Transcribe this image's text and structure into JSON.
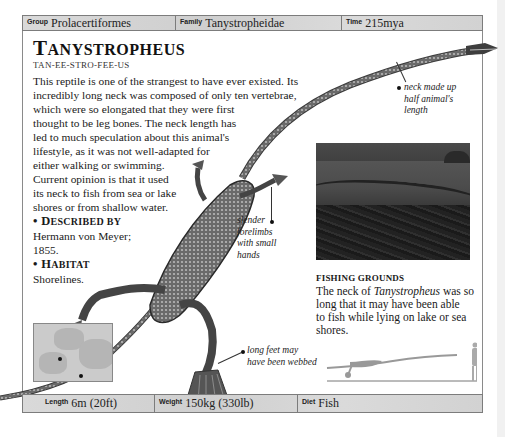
{
  "header": {
    "group": {
      "label": "Group",
      "value": "Prolacertiformes"
    },
    "family": {
      "label": "Family",
      "value": "Tanystropheidae"
    },
    "time": {
      "label": "Time",
      "value": "215mya"
    }
  },
  "title": {
    "first": "T",
    "rest": "ANYSTROPHEUS"
  },
  "pronunciation": "TAN-EE-STRO-FEE-US",
  "body_lines": [
    "This reptile is one of the strangest to have ever existed. Its",
    "incredibly long neck was composed of only ten vertebrae,",
    "which were so elongated that they were first",
    "thought to be leg bones. The neck length has",
    "led to much speculation about this animal's",
    "lifestyle, as it was not well-adapted for",
    "either walking or swimming.",
    "Current opinion is that it used",
    "its neck to fish from sea or lake",
    "shores or from shallow water."
  ],
  "described_by": {
    "bullet": "•",
    "first": "D",
    "rest": "ESCRIBED BY",
    "lines": [
      "Hermann von Meyer;",
      "1855."
    ]
  },
  "habitat": {
    "bullet": "•",
    "first": "H",
    "rest": "ABITAT",
    "lines": [
      "Shorelines."
    ]
  },
  "annotations": {
    "neck": [
      "neck made up",
      "half animal's",
      "length"
    ],
    "forelimbs": [
      "slender",
      "forelimbs",
      "with small",
      "hands"
    ],
    "feet": [
      "long feet may",
      "have been webbed"
    ]
  },
  "photo_caption": {
    "heading": "FISHING GROUNDS",
    "line1_pre": "The neck of ",
    "line1_em": "Tanystropheus",
    "line1_post": " was so",
    "lines": [
      "long that it may have been able",
      "to fish while lying on lake or sea",
      "shores."
    ]
  },
  "footer": {
    "length": {
      "label": "Length",
      "value": "6m (20ft)"
    },
    "weight": {
      "label": "Weight",
      "value": "150kg (330lb)"
    },
    "diet": {
      "label": "Diet",
      "value": "Fish"
    }
  }
}
